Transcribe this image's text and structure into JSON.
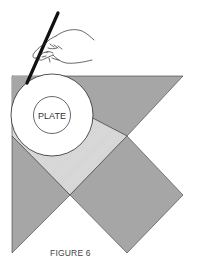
{
  "figure": {
    "caption": "FIGURE 6",
    "plate_label": "PLATE",
    "colors": {
      "piece_fill": "#a6a6a6",
      "hatched_fill": "#d9d9d9",
      "outline": "#3a3a3a",
      "plate_fill": "#ffffff",
      "pencil": "#111111",
      "background": "#ffffff"
    },
    "elements": [
      {
        "name": "hand-holding-pencil",
        "type": "illustration"
      },
      {
        "name": "plate",
        "type": "circle",
        "label": "PLATE"
      },
      {
        "name": "top-triangle",
        "type": "shaded-piece"
      },
      {
        "name": "left-triangle",
        "type": "shaded-piece"
      },
      {
        "name": "right-diamond",
        "type": "shaded-piece"
      },
      {
        "name": "center-hatched-area",
        "type": "hatched-piece"
      }
    ]
  }
}
